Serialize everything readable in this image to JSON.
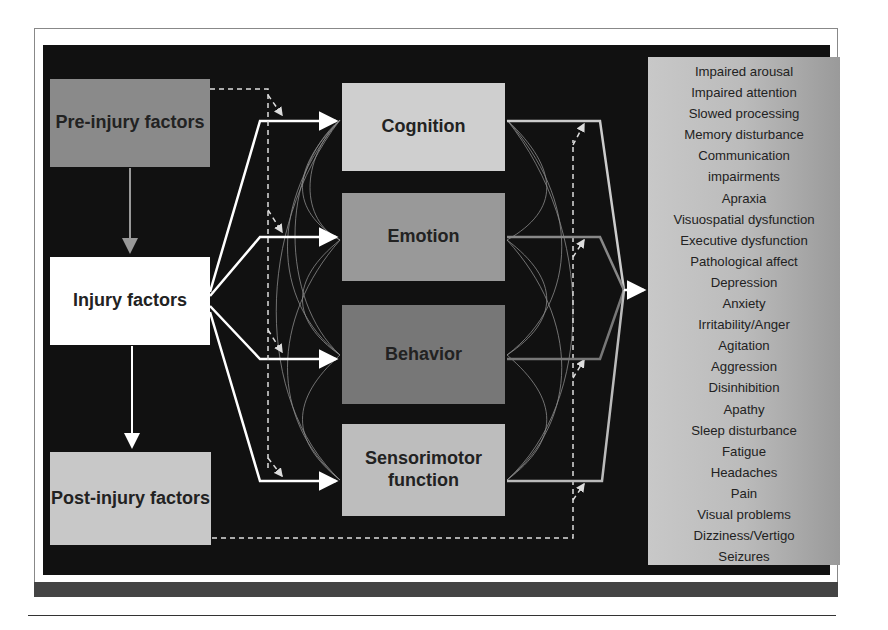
{
  "diagram": {
    "left_column": [
      {
        "id": "pre",
        "label": "Pre-injury factors"
      },
      {
        "id": "inj",
        "label": "Injury factors"
      },
      {
        "id": "post",
        "label": "Post-injury factors"
      }
    ],
    "middle_column": [
      {
        "id": "cog",
        "label": "Cognition"
      },
      {
        "id": "emo",
        "label": "Emotion"
      },
      {
        "id": "beh",
        "label": "Behavior"
      },
      {
        "id": "sen",
        "label": "Sensorimotor function"
      }
    ],
    "outcomes": [
      "Impaired arousal",
      "Impaired attention",
      "Slowed processing",
      "Memory disturbance",
      "Communication",
      "impairments",
      "Apraxia",
      "Visuospatial dysfunction",
      "Executive dysfunction",
      "Pathological affect",
      "Depression",
      "Anxiety",
      "Irritability/Anger",
      "Agitation",
      "Aggression",
      "Disinhibition",
      "Apathy",
      "Sleep disturbance",
      "Fatigue",
      "Headaches",
      "Pain",
      "Visual problems",
      "Dizziness/Vertigo",
      "Seizures"
    ],
    "edges": [
      {
        "from": "pre",
        "to": "inj",
        "style": "solid-gray-arrow"
      },
      {
        "from": "inj",
        "to": "post",
        "style": "solid-white-arrow"
      },
      {
        "from": "inj",
        "to": [
          "cog",
          "emo",
          "beh",
          "sen"
        ],
        "style": "solid-white-arrows"
      },
      {
        "from": "pre",
        "to": [
          "cog",
          "emo",
          "beh",
          "sen"
        ],
        "style": "dashed-arrows"
      },
      {
        "from": "post",
        "to": "outcomes",
        "style": "dashed-arrows"
      },
      {
        "from": [
          "cog",
          "emo",
          "beh",
          "sen"
        ],
        "to": "outcomes",
        "style": "converging-arrow"
      },
      {
        "from": "middle_column",
        "to": "middle_column",
        "style": "curved-interconnections"
      }
    ],
    "colors": {
      "background": "#111111",
      "pre": "#8a8a8a",
      "injury": "#ffffff",
      "post": "#c8c8c8",
      "cognition": "#cfcfcf",
      "emotion": "#999999",
      "behavior": "#777777",
      "sensorimotor": "#bdbdbd"
    }
  }
}
